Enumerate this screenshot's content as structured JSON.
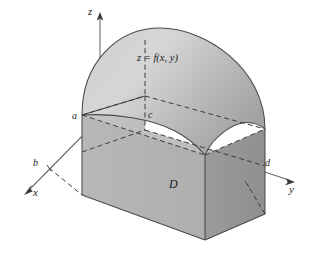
{
  "figure": {
    "background_color": "#ffffff",
    "surface_label": "z = f(x, y)",
    "region_label": "D",
    "axes": [
      {
        "name": "z-axis",
        "label": "z",
        "direction": "up"
      },
      {
        "name": "x-axis",
        "label": "x",
        "direction": "down-left"
      },
      {
        "name": "y-axis",
        "label": "y",
        "direction": "down-right"
      }
    ],
    "tick_labels": [
      {
        "name": "a",
        "label": "a",
        "axis": "z-axis-height-marker"
      },
      {
        "name": "b",
        "label": "b",
        "axis": "x-axis"
      },
      {
        "name": "c",
        "label": "c",
        "axis": "interior-corner"
      },
      {
        "name": "d",
        "label": "d",
        "axis": "y-axis"
      }
    ],
    "colors": {
      "outline": "#4a4a4a",
      "dashed": "#3d3d3d",
      "axis": "#6b6b6b",
      "top_surface_light": "#d2d2d2",
      "top_surface_dark": "#a8a8a8",
      "front_left_face": "#b3b3b3",
      "front_right_face": "#9a9a9a",
      "base_face": "#bdbdbd",
      "left_side_face": "#c4c4c4",
      "text": "#1a1a1a"
    }
  }
}
